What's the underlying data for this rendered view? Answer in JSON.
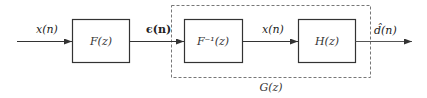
{
  "diagram": {
    "type": "block-diagram",
    "signals": {
      "input": "x(n)",
      "error": "ϵ(n)",
      "middle": "x(n)",
      "output": "d̂(n)"
    },
    "blocks": [
      {
        "id": "F",
        "label": "F(z)"
      },
      {
        "id": "Finv",
        "label": "F⁻¹(z)"
      },
      {
        "id": "H",
        "label": "H(z)"
      }
    ],
    "group": {
      "label": "G(z)",
      "contains": [
        "Finv",
        "H"
      ]
    },
    "colors": {
      "stroke": "#333333",
      "dashed": "#777777",
      "background": "#ffffff"
    }
  }
}
